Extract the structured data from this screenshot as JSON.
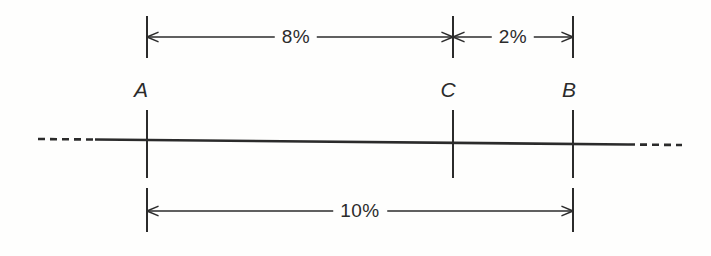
{
  "figure": {
    "type": "engineering-dimension-diagram",
    "title": "",
    "background_color": "#fefefd",
    "line_color": "#2b2b2b",
    "points": [
      {
        "id": "A",
        "label": "A",
        "x": 147,
        "label_x": 141,
        "label_y": 102
      },
      {
        "id": "C",
        "label": "C",
        "x": 453,
        "label_x": 448,
        "label_y": 102
      },
      {
        "id": "B",
        "label": "B",
        "x": 573,
        "label_x": 569,
        "label_y": 102
      }
    ],
    "dimensions": [
      {
        "id": "dim-ac",
        "label": "8%",
        "from": "A",
        "to": "C",
        "x1": 147,
        "x2": 453,
        "y": 37,
        "label_x": 296,
        "label_y": 37,
        "arrow_start": true,
        "arrow_end": true
      },
      {
        "id": "dim-cb",
        "label": "2%",
        "from": "C",
        "to": "B",
        "x1": 453,
        "x2": 573,
        "y": 37,
        "label_x": 513,
        "label_y": 37,
        "arrow_start": true,
        "arrow_end": true
      },
      {
        "id": "dim-ab",
        "label": "10%",
        "from": "A",
        "to": "B",
        "x1": 147,
        "x2": 573,
        "y": 211,
        "label_x": 360,
        "label_y": 211,
        "arrow_start": true,
        "arrow_end": true
      }
    ],
    "baseline": {
      "id": "baseline",
      "y_left": 139,
      "y_right": 145,
      "solid_start_x": 95,
      "solid_end_x": 628,
      "dash_left_start_x": 38,
      "dash_right_end_x": 682,
      "dash_pattern": "7 5"
    },
    "extension_lines": [
      {
        "point": "A",
        "x": 147,
        "y1": 16,
        "y2": 58
      },
      {
        "point": "A",
        "x": 147,
        "y1": 110,
        "y2": 178
      },
      {
        "point": "A",
        "x": 147,
        "y1": 188,
        "y2": 232
      },
      {
        "point": "C",
        "x": 453,
        "y1": 16,
        "y2": 58
      },
      {
        "point": "C",
        "x": 453,
        "y1": 110,
        "y2": 178
      },
      {
        "point": "B",
        "x": 573,
        "y1": 16,
        "y2": 58
      },
      {
        "point": "B",
        "x": 573,
        "y1": 110,
        "y2": 178
      },
      {
        "point": "B",
        "x": 573,
        "y1": 188,
        "y2": 232
      }
    ]
  }
}
